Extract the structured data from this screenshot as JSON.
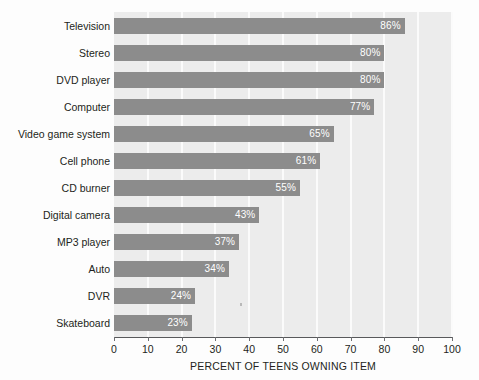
{
  "chart_data": {
    "type": "bar",
    "orientation": "horizontal",
    "title": "",
    "xlabel": "PERCENT OF TEENS OWNING ITEM",
    "ylabel": "",
    "xlim": [
      0,
      100
    ],
    "xticks": [
      0,
      10,
      20,
      30,
      40,
      50,
      60,
      70,
      80,
      90,
      100
    ],
    "xtick_labels": [
      "0",
      "10",
      "20",
      "30",
      "40",
      "50",
      "60",
      "70",
      "80",
      "90",
      "100"
    ],
    "grid": "vertical",
    "legend": "none",
    "value_label_suffix": "%",
    "categories": [
      "Television",
      "Stereo",
      "DVD player",
      "Computer",
      "Video game system",
      "Cell phone",
      "CD burner",
      "Digital camera",
      "MP3 player",
      "Auto",
      "DVR",
      "Skateboard"
    ],
    "values": [
      86,
      80,
      80,
      77,
      65,
      61,
      55,
      43,
      37,
      34,
      24,
      23
    ],
    "value_labels": [
      "86%",
      "80%",
      "80%",
      "77%",
      "65%",
      "61%",
      "55%",
      "43%",
      "37%",
      "34%",
      "24%",
      "23%"
    ],
    "colors": {
      "bar": "#8c8c8c",
      "plot_background": "#ececec",
      "gridline": "#fbfbfb",
      "axis": "#58595b",
      "text": "#231f20",
      "value_label_text": "#ffffff",
      "page_background": "#fdfdfd"
    }
  }
}
